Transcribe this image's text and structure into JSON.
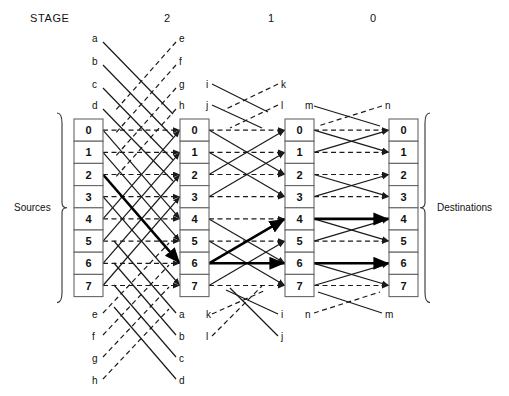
{
  "diagram": {
    "title_label": "STAGE",
    "stage_numbers": [
      "2",
      "1",
      "0"
    ],
    "left_bracket_label": "Sources",
    "right_bracket_label": "Destinations",
    "node_labels": [
      "0",
      "1",
      "2",
      "3",
      "4",
      "5",
      "6",
      "7"
    ],
    "columns": [
      {
        "name": "column-sources",
        "nodes": [
          "0",
          "1",
          "2",
          "3",
          "4",
          "5",
          "6",
          "7"
        ]
      },
      {
        "name": "column-stage-2",
        "nodes": [
          "0",
          "1",
          "2",
          "3",
          "4",
          "5",
          "6",
          "7"
        ]
      },
      {
        "name": "column-stage-1",
        "nodes": [
          "0",
          "1",
          "2",
          "3",
          "4",
          "5",
          "6",
          "7"
        ]
      },
      {
        "name": "column-destinations",
        "nodes": [
          "0",
          "1",
          "2",
          "3",
          "4",
          "5",
          "6",
          "7"
        ]
      }
    ],
    "wrap_labels": {
      "stage2_top_left": [
        "a",
        "b",
        "c",
        "d"
      ],
      "stage2_top_right": [
        "e",
        "f",
        "g",
        "h"
      ],
      "stage2_bottom_left": [
        "e",
        "f",
        "g",
        "h"
      ],
      "stage2_bottom_right": [
        "a",
        "b",
        "c",
        "d"
      ],
      "stage1_top_left": [
        "i",
        "j"
      ],
      "stage1_top_right": [
        "k",
        "l"
      ],
      "stage1_bottom_left": [
        "k",
        "l"
      ],
      "stage1_bottom_right": [
        "i",
        "j"
      ],
      "stage0_top_left": [
        "m"
      ],
      "stage0_top_right": [
        "n"
      ],
      "stage0_bottom_left": [
        "n"
      ],
      "stage0_bottom_right": [
        "m"
      ]
    },
    "colors": {
      "line": "#1a1a1a",
      "highlight": "#000000",
      "box_stroke": "#666666",
      "background": "#ffffff"
    },
    "highlight_path": {
      "description": "bold broadcast tree",
      "edges": [
        {
          "from_col": 0,
          "from_node": 2,
          "to_col": 1,
          "to_node": 6
        },
        {
          "from_col": 1,
          "from_node": 6,
          "to_col": 2,
          "to_node": 4
        },
        {
          "from_col": 1,
          "from_node": 6,
          "to_col": 2,
          "to_node": 6
        },
        {
          "from_col": 2,
          "from_node": 4,
          "to_col": 3,
          "to_node": 3
        },
        {
          "from_col": 2,
          "from_node": 4,
          "to_col": 3,
          "to_node": 4
        },
        {
          "from_col": 2,
          "from_node": 6,
          "to_col": 3,
          "to_node": 5
        },
        {
          "from_col": 2,
          "from_node": 6,
          "to_col": 3,
          "to_node": 6
        }
      ]
    }
  }
}
